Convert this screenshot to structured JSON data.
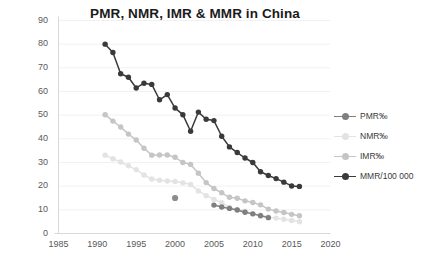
{
  "chart_data": {
    "type": "line",
    "title": "PMR, NMR, IMR & MMR in China",
    "xlabel": "",
    "ylabel": "",
    "xlim": [
      1985,
      2020
    ],
    "ylim": [
      0,
      90
    ],
    "xticks": [
      "1985",
      "1990",
      "1995",
      "2000",
      "2005",
      "2010",
      "2015",
      "2020"
    ],
    "yticks": [
      "0",
      "10",
      "20",
      "30",
      "40",
      "50",
      "60",
      "70",
      "80",
      "90"
    ],
    "grid": true,
    "legend_position": "right",
    "series": [
      {
        "name": "PMR‰",
        "color": "#7f7f7f",
        "x": [
          2005,
          2006,
          2007,
          2008,
          2009,
          2010,
          2011,
          2012
        ],
        "values": [
          12.0,
          11.2,
          10.6,
          9.9,
          9.0,
          8.3,
          7.5,
          6.7
        ]
      },
      {
        "name": "NMR‰",
        "color": "#e3e3e3",
        "x": [
          1991,
          1992,
          1993,
          1994,
          1995,
          1996,
          1997,
          1998,
          1999,
          2000,
          2001,
          2002,
          2003,
          2004,
          2005,
          2006,
          2007,
          2008,
          2009,
          2010,
          2011,
          2012,
          2013,
          2014,
          2015,
          2016
        ],
        "values": [
          33.1,
          31.6,
          30.2,
          28.6,
          27.0,
          24.7,
          23.0,
          22.5,
          22.2,
          22.0,
          21.4,
          20.7,
          18.0,
          16.0,
          14.4,
          13.0,
          11.0,
          10.2,
          9.4,
          8.3,
          7.8,
          7.0,
          6.5,
          6.0,
          5.5,
          5.0
        ]
      },
      {
        "name": "IMR‰",
        "color": "#c5c5c5",
        "x": [
          1991,
          1992,
          1993,
          1994,
          1995,
          1996,
          1997,
          1998,
          1999,
          2000,
          2001,
          2002,
          2003,
          2004,
          2005,
          2006,
          2007,
          2008,
          2009,
          2010,
          2011,
          2012,
          2013,
          2014,
          2015,
          2016
        ],
        "values": [
          50.2,
          47.5,
          45.0,
          42.0,
          39.5,
          36.0,
          33.1,
          33.2,
          33.2,
          32.2,
          30.0,
          29.2,
          25.5,
          21.5,
          19.0,
          17.2,
          15.3,
          14.9,
          13.8,
          13.1,
          12.1,
          10.3,
          9.5,
          8.9,
          8.1,
          7.5
        ]
      },
      {
        "name": "MMR/100 000",
        "color": "#3a3a3a",
        "x": [
          1991,
          1992,
          1993,
          1994,
          1995,
          1996,
          1997,
          1998,
          1999,
          2000,
          2001,
          2002,
          2003,
          2004,
          2005,
          2006,
          2007,
          2008,
          2009,
          2010,
          2011,
          2012,
          2013,
          2014,
          2015,
          2016
        ],
        "values": [
          80.0,
          76.5,
          67.5,
          66.0,
          61.5,
          63.5,
          63.0,
          56.5,
          58.7,
          53.0,
          50.2,
          43.2,
          51.3,
          48.3,
          47.7,
          41.1,
          36.6,
          34.2,
          31.9,
          30.0,
          26.1,
          24.5,
          23.2,
          21.7,
          20.1,
          19.9
        ]
      }
    ],
    "outlier_point": {
      "name": "isolated-marker",
      "color": "#8c8c8c",
      "x": 2000,
      "y": 15.0
    }
  }
}
